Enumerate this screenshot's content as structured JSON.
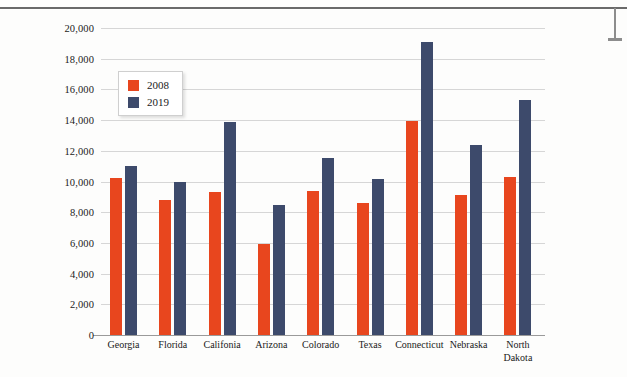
{
  "chart_data": {
    "type": "bar",
    "title": "",
    "xlabel": "",
    "ylabel": "",
    "ylim": [
      0,
      20000
    ],
    "ytick_step": 2000,
    "grid": true,
    "legend_position": "upper-left-inside",
    "categories": [
      "Georgia",
      "Florida",
      "Califonia",
      "Arizona",
      "Colorado",
      "Texas",
      "Connecticut",
      "Nebraska",
      "North\nDakota"
    ],
    "ytick_labels": [
      "20,000",
      "18,000",
      "16,000",
      "14,000",
      "12,000",
      "10,000",
      "8,000",
      "6,000",
      "4,000",
      "2,000",
      "0"
    ],
    "series": [
      {
        "name": "2008",
        "color": "#e8461e",
        "values": [
          10200,
          8800,
          9300,
          5900,
          9350,
          8600,
          13950,
          9150,
          10300
        ]
      },
      {
        "name": "2019",
        "color": "#3d4a6b",
        "values": [
          11000,
          10000,
          13900,
          8500,
          11500,
          10150,
          19100,
          12400,
          15300
        ]
      }
    ]
  }
}
